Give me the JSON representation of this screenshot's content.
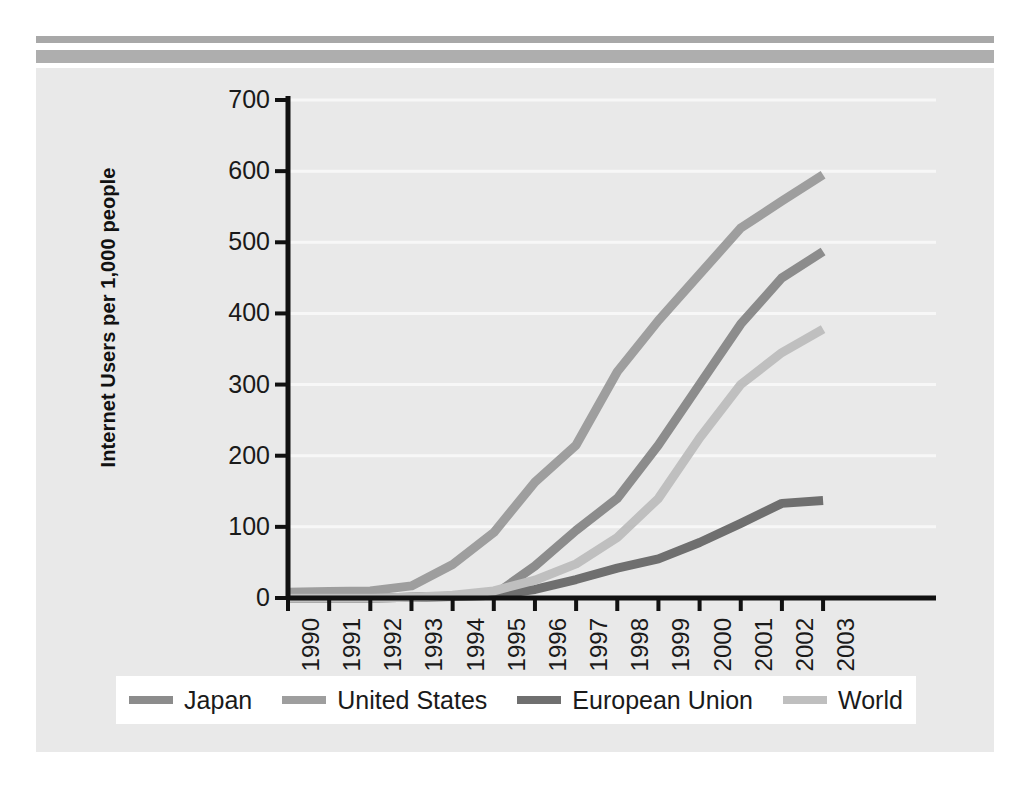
{
  "page": {
    "background": "#ffffff",
    "panel_color": "#e9e9e9",
    "rule_top_color": "#a8a8a8",
    "rule_bottom_color": "#aeaeae"
  },
  "chart_data": {
    "type": "line",
    "title": "",
    "xlabel": "",
    "ylabel": "Internet Users per 1,000 people",
    "ylim": [
      0,
      700
    ],
    "yticks": [
      0,
      100,
      200,
      300,
      400,
      500,
      600,
      700
    ],
    "grid": true,
    "grid_color": "#f7f7f7",
    "legend_position": "bottom",
    "categories": [
      "1990",
      "1991",
      "1992",
      "1993",
      "1994",
      "1995",
      "1996",
      "1997",
      "1998",
      "1999",
      "2000",
      "2001",
      "2002",
      "2003"
    ],
    "series": [
      {
        "name": "Japan",
        "color": "#8c8c8c",
        "values": [
          0,
          0,
          0,
          1,
          2,
          4,
          45,
          95,
          140,
          215,
          300,
          385,
          450,
          487
        ]
      },
      {
        "name": "United States",
        "color": "#9e9e9e",
        "values": [
          8,
          9,
          10,
          17,
          47,
          92,
          163,
          215,
          318,
          390,
          455,
          520,
          558,
          595
        ]
      },
      {
        "name": "European Union",
        "color": "#6f6f6f",
        "values": [
          0,
          0,
          0,
          1,
          2,
          4,
          12,
          26,
          42,
          55,
          78,
          105,
          133,
          137
        ]
      },
      {
        "name": "World",
        "color": "#bfbfbf",
        "values": [
          0,
          0,
          0,
          1,
          4,
          10,
          25,
          48,
          85,
          140,
          225,
          300,
          345,
          378
        ]
      }
    ]
  },
  "legend": {
    "entries": [
      {
        "label": "Japan",
        "color": "#8c8c8c"
      },
      {
        "label": "United States",
        "color": "#9e9e9e"
      },
      {
        "label": "European Union",
        "color": "#6f6f6f"
      },
      {
        "label": "World",
        "color": "#bfbfbf"
      }
    ]
  }
}
